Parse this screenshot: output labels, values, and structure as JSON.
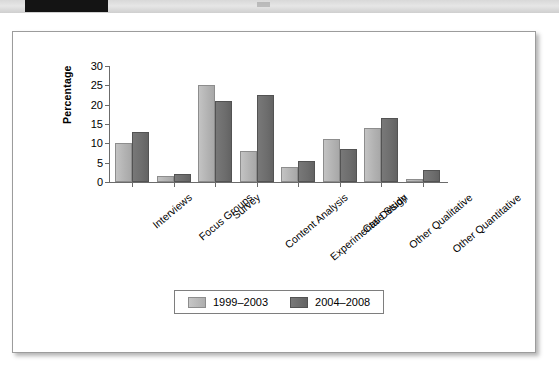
{
  "page_header": {
    "black_block_label": "",
    "center_mark_label": ""
  },
  "chart_data": {
    "type": "bar",
    "title": "",
    "xlabel": "",
    "ylabel": "Percentage",
    "ylim": [
      0,
      30
    ],
    "ytick_labels": [
      "30",
      "25",
      "20",
      "15",
      "10",
      "5",
      "0"
    ],
    "ytick_values": [
      30,
      25,
      20,
      15,
      10,
      5,
      0
    ],
    "grid": false,
    "legend_position": "bottom-center",
    "categories": [
      "Interviews",
      "Focus Groups",
      "Survey",
      "Content Analysis",
      "Experimental Design",
      "Case Study",
      "Other Qualitative",
      "Other Quantitative"
    ],
    "series": [
      {
        "name": "1999–2003",
        "color": "#b2b2b2",
        "values": [
          10,
          1.5,
          25,
          8,
          4,
          11,
          14,
          0.7
        ]
      },
      {
        "name": "2004–2008",
        "color": "#6d6d6d",
        "values": [
          13,
          2,
          21,
          22.5,
          5.5,
          8.5,
          16.5,
          3
        ]
      }
    ]
  }
}
